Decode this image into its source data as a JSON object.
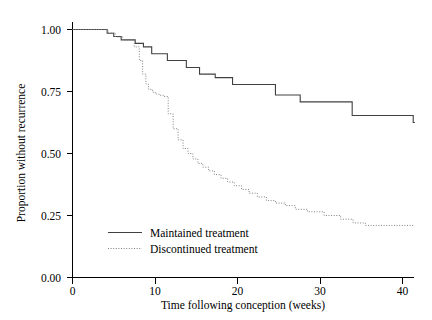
{
  "chart_data": {
    "type": "line",
    "title": "",
    "xlabel": "Time following conception (weeks)",
    "ylabel": "Proportion without recurrence",
    "xlim": [
      0,
      41.5
    ],
    "ylim": [
      0.0,
      1.0
    ],
    "xticks": [
      0,
      10,
      20,
      30,
      40
    ],
    "xticklabels": [
      "0",
      "10",
      "20",
      "30",
      "40"
    ],
    "yticks": [
      0.0,
      0.25,
      0.5,
      0.75,
      1.0
    ],
    "yticklabels": [
      "0.00",
      "0.25",
      "0.50",
      "0.75",
      "1.00"
    ],
    "grid": false,
    "legend_position": "lower left",
    "step_type": "post",
    "series": [
      {
        "name": "Maintained treatment",
        "style": "solid",
        "color": "#404040",
        "x": [
          0,
          3.2,
          4.2,
          5.0,
          5.9,
          6.8,
          7.6,
          8.6,
          9.6,
          11.5,
          13.8,
          15.4,
          17.3,
          19.4,
          22.1,
          24.6,
          27.6,
          33.9,
          41.3
        ],
        "y": [
          1.0,
          1.0,
          0.985,
          0.972,
          0.958,
          0.958,
          0.944,
          0.93,
          0.902,
          0.875,
          0.847,
          0.82,
          0.806,
          0.778,
          0.778,
          0.736,
          0.708,
          0.653,
          0.625
        ]
      },
      {
        "name": "Discontinued treatment",
        "style": "dotted",
        "color": "#808080",
        "x": [
          0,
          3.3,
          4.3,
          5.2,
          6.1,
          6.9,
          7.5,
          8.1,
          8.5,
          8.9,
          9.2,
          9.5,
          9.8,
          10.1,
          10.5,
          11.0,
          11.6,
          12.2,
          12.8,
          13.4,
          14.0,
          14.6,
          15.2,
          15.8,
          16.5,
          17.2,
          18.0,
          18.8,
          19.6,
          20.5,
          21.4,
          22.4,
          23.5,
          24.6,
          25.8,
          27.0,
          28.5,
          30.5,
          32.5,
          34.0,
          35.5,
          41.3
        ],
        "y": [
          1.0,
          1.0,
          0.986,
          0.97,
          0.957,
          0.957,
          0.93,
          0.875,
          0.82,
          0.78,
          0.76,
          0.755,
          0.745,
          0.74,
          0.735,
          0.73,
          0.66,
          0.6,
          0.555,
          0.52,
          0.5,
          0.478,
          0.46,
          0.445,
          0.43,
          0.415,
          0.4,
          0.385,
          0.37,
          0.355,
          0.34,
          0.325,
          0.31,
          0.3,
          0.29,
          0.275,
          0.265,
          0.25,
          0.235,
          0.22,
          0.21,
          0.21
        ]
      }
    ]
  },
  "legend": {
    "entries": [
      {
        "label": "Maintained treatment",
        "style": "solid"
      },
      {
        "label": "Discontinued treatment",
        "style": "dotted"
      }
    ]
  },
  "axes": {
    "x_title": "Time following conception (weeks)",
    "y_title": "Proportion without recurrence",
    "x_tick_labels": [
      "0",
      "10",
      "20",
      "30",
      "40"
    ],
    "y_tick_labels": [
      "0.00",
      "0.25",
      "0.50",
      "0.75",
      "1.00"
    ]
  },
  "colors": {
    "axis": "#000000",
    "maintained": "#404040",
    "discontinued": "#808080",
    "background": "#ffffff"
  }
}
